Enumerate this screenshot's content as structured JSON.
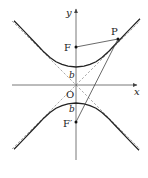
{
  "figure": {
    "type": "hyperbola-foci-diagram",
    "labels": {
      "y_axis": "y",
      "x_axis": "x",
      "origin": "O",
      "focus_upper": "F",
      "focus_lower": "F′",
      "point": "P",
      "semi_axis_upper": "b",
      "semi_axis_lower": "b"
    },
    "colors": {
      "curve": "#222222",
      "axis": "#555555",
      "asymptote": "#888888",
      "segment": "#444444"
    }
  }
}
